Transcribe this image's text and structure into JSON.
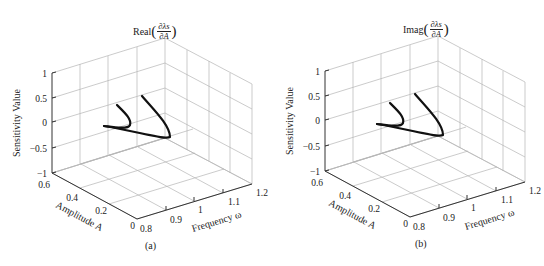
{
  "chart_data": [
    {
      "type": "line3d",
      "panel_label": "(a)",
      "title": "Real(∂λs/∂A)",
      "title_parts": {
        "prefix": "Real",
        "numerator": "∂λs",
        "denominator": "∂A"
      },
      "xlabel": "Frequency ω",
      "ylabel": "Amplitude A",
      "zlabel": "Sensitivity Value",
      "x_ticks": [
        "0.8",
        "0.9",
        "1",
        "1.1",
        "1.2"
      ],
      "y_ticks": [
        "0",
        "0.2",
        "0.4",
        "0.6"
      ],
      "z_ticks": [
        "1",
        "0.5",
        "0",
        "−0.5",
        "−1"
      ],
      "xlim": [
        0.8,
        1.2
      ],
      "ylim": [
        0,
        0.6
      ],
      "zlim": [
        -1,
        1
      ],
      "grid": true,
      "series": [
        {
          "name": "branch-1",
          "points_xyz": [
            [
              0.86,
              0.38,
              0.35
            ],
            [
              0.92,
              0.3,
              0.05
            ],
            [
              0.95,
              0.25,
              -0.05
            ],
            [
              0.9,
              0.32,
              -0.05
            ],
            [
              0.84,
              0.42,
              0.0
            ]
          ]
        },
        {
          "name": "branch-2",
          "points_xyz": [
            [
              0.96,
              0.44,
              0.45
            ],
            [
              1.02,
              0.3,
              0.05
            ],
            [
              1.05,
              0.2,
              -0.35
            ],
            [
              0.96,
              0.3,
              -0.2
            ],
            [
              0.84,
              0.42,
              0.0
            ]
          ]
        }
      ]
    },
    {
      "type": "line3d",
      "panel_label": "(b)",
      "title": "Imag(∂λs/∂A)",
      "title_parts": {
        "prefix": "Imag",
        "numerator": "∂λs",
        "denominator": "∂A"
      },
      "xlabel": "Frequency ω",
      "ylabel": "Amplitude A",
      "zlabel": "Sensitivity Value",
      "x_ticks": [
        "0.8",
        "0.9",
        "1",
        "1.1",
        "1.2"
      ],
      "y_ticks": [
        "0",
        "0.2",
        "0.4",
        "0.6"
      ],
      "z_ticks": [
        "1",
        "0.5",
        "0",
        "−0.5",
        "−1"
      ],
      "xlim": [
        0.8,
        1.2
      ],
      "ylim": [
        0,
        0.6
      ],
      "zlim": [
        -1,
        1
      ],
      "grid": true,
      "series": [
        {
          "name": "branch-1",
          "points_xyz": [
            [
              0.86,
              0.38,
              0.35
            ],
            [
              0.92,
              0.3,
              0.05
            ],
            [
              0.95,
              0.25,
              -0.05
            ],
            [
              0.9,
              0.32,
              -0.05
            ],
            [
              0.84,
              0.42,
              0.0
            ]
          ]
        },
        {
          "name": "branch-2",
          "points_xyz": [
            [
              0.96,
              0.44,
              0.45
            ],
            [
              1.02,
              0.3,
              0.05
            ],
            [
              1.05,
              0.2,
              -0.35
            ],
            [
              0.96,
              0.3,
              -0.2
            ],
            [
              0.84,
              0.42,
              0.0
            ]
          ]
        }
      ]
    }
  ],
  "panels": [
    {
      "label": "(a)",
      "title_prefix": "Real",
      "title_num": "∂λs",
      "title_den": "∂A",
      "zlabel": "Sensitivity Value",
      "xlabel": "Frequency ω",
      "ylabel": "Amplitude A",
      "z_ticks": [
        "1",
        "0.5",
        "0",
        "−0.5",
        "−1"
      ],
      "x_ticks": [
        "0.8",
        "0.9",
        "1",
        "1.1",
        "1.2"
      ],
      "y_ticks": [
        "0",
        "0.2",
        "0.4",
        "0.6"
      ]
    },
    {
      "label": "(b)",
      "title_prefix": "Imag",
      "title_num": "∂λs",
      "title_den": "∂A",
      "zlabel": "Sensitivity Value",
      "xlabel": "Frequency ω",
      "ylabel": "Amplitude A",
      "z_ticks": [
        "1",
        "0.5",
        "0",
        "−0.5",
        "−1"
      ],
      "x_ticks": [
        "0.8",
        "0.9",
        "1",
        "1.1",
        "1.2"
      ],
      "y_ticks": [
        "0",
        "0.2",
        "0.4",
        "0.6"
      ]
    }
  ]
}
